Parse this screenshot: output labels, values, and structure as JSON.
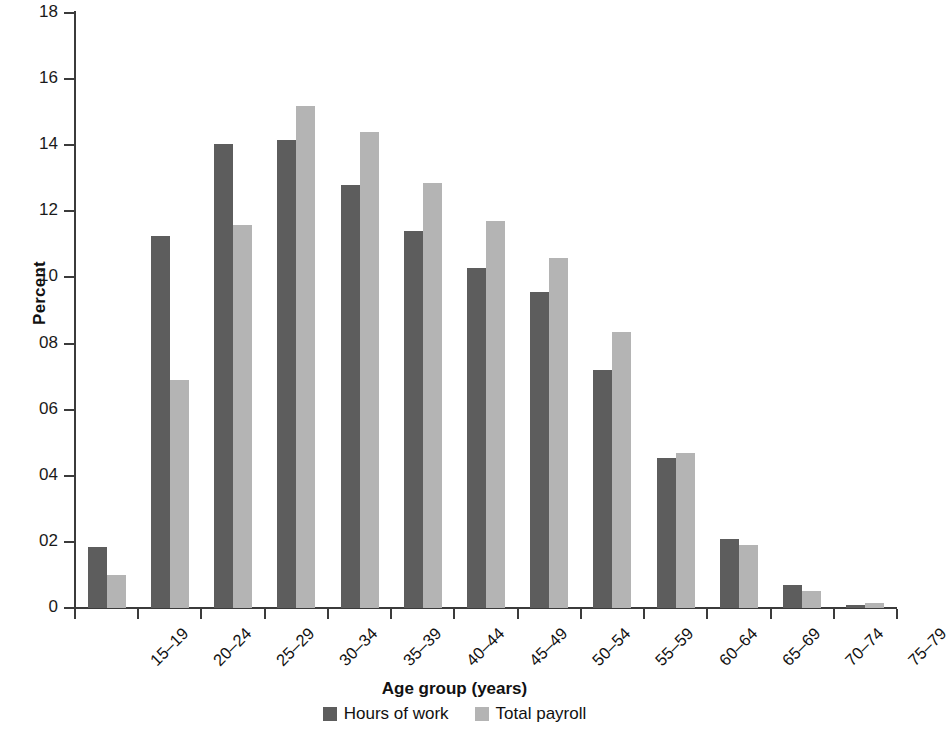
{
  "chart_data": {
    "type": "bar",
    "title": "",
    "xlabel": "Age group (years)",
    "ylabel": "Percent",
    "ylim": [
      0,
      18
    ],
    "ytick_labels": [
      "0",
      "02",
      "04",
      "06",
      "08",
      "10",
      "12",
      "14",
      "16",
      "18"
    ],
    "ytick_values": [
      0,
      2,
      4,
      6,
      8,
      10,
      12,
      14,
      16,
      18
    ],
    "grid": false,
    "legend_position": "bottom",
    "categories": [
      "15–19",
      "20–24",
      "25–29",
      "30–34",
      "35–39",
      "40–44",
      "45–49",
      "50–54",
      "55–59",
      "60–64",
      "65–69",
      "70–74",
      "75–79"
    ],
    "series": [
      {
        "name": "Hours of work",
        "color": "#5d5d5d",
        "values": [
          1.85,
          11.25,
          14.05,
          14.15,
          12.8,
          11.4,
          10.3,
          9.55,
          7.2,
          4.55,
          2.1,
          0.7,
          0.1
        ]
      },
      {
        "name": "Total payroll",
        "color": "#b4b4b4",
        "values": [
          1.0,
          6.9,
          11.6,
          15.2,
          14.4,
          12.85,
          11.7,
          10.6,
          8.35,
          4.7,
          1.9,
          0.5,
          0.15
        ]
      }
    ]
  },
  "axis": {
    "y_title": "Percent",
    "x_title": "Age group (years)"
  }
}
